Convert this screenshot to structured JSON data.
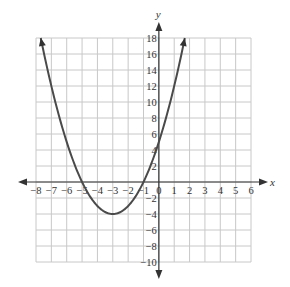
{
  "chart_data": {
    "type": "line",
    "title": "",
    "xlabel": "x",
    "ylabel": "y",
    "xlim": [
      -8,
      6
    ],
    "ylim": [
      -10,
      18
    ],
    "grid": true,
    "x_grid_step": 1,
    "y_grid_step": 2,
    "x_ticks": [
      -8,
      -7,
      -6,
      -5,
      -4,
      -3,
      -2,
      -1,
      0,
      1,
      2,
      3,
      4,
      5,
      6
    ],
    "x_tick_labels": [
      "−8",
      "−7",
      "−6",
      "−5",
      "−4",
      "−3",
      "−2",
      "−1",
      "0",
      "1",
      "2",
      "3",
      "4",
      "5",
      "6"
    ],
    "y_ticks": [
      18,
      16,
      14,
      12,
      10,
      8,
      6,
      4,
      2,
      -2,
      -4,
      -6,
      -8,
      -10
    ],
    "y_tick_labels": [
      "18",
      "16",
      "14",
      "12",
      "10",
      "8",
      "6",
      "4",
      "2",
      "−2",
      "−4",
      "−6",
      "−8",
      "−10"
    ],
    "series": [
      {
        "name": "parabola",
        "equation": "y = x^2 + 6x + 5",
        "coefficients": {
          "a": 1,
          "b": 6,
          "c": 5
        },
        "vertex": [
          -3,
          -4
        ],
        "x_intercepts": [
          -5,
          -1
        ],
        "y_intercept": 5,
        "x_range": [
          -7.69,
          1.69
        ],
        "color": "#4a4a4a",
        "arrows_on_ends": true
      }
    ],
    "axis_color": "#333333",
    "grid_color": "#c8c8c8"
  }
}
